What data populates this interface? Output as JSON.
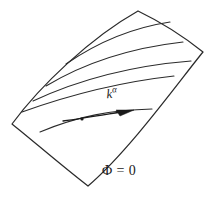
{
  "figure": {
    "kind": "line-diagram",
    "title_visible": false,
    "background_color": "#ffffff",
    "ink_color": "#2b2b2b",
    "labels": {
      "vector_base": "k",
      "vector_superscript": "α",
      "surface_equation": "Φ = 0"
    },
    "annotations": {
      "generator_curve_count": 5,
      "marked_point_count": 1,
      "arrow_count": 1
    },
    "geometry": {
      "surface_corners": {
        "top_apex": [
          138,
          11
        ],
        "right": [
          203,
          52
        ],
        "bottom_tip": [
          88,
          186
        ],
        "left": [
          12,
          124
        ]
      },
      "surface_outline_path": "M 12 124 C 40 86 90 38 138 11 C 165 24 188 40 203 52 C 180 80 130 150 88 186 C 62 166 32 140 12 124 Z",
      "generator_curves": [
        "M 66 64 C 95 44 130 28 170 22",
        "M 46 86 C 86 62 130 48 183 42",
        "M 33 101 C 78 80 128 66 191 61",
        "M 22 112 C 72 94 120 82 174 76",
        "M 40 132 C 78 116 112 110 152 109"
      ],
      "vector_arrow": {
        "shaft": "M 63 121 C 85 118 108 114 127 111",
        "head_tip": [
          134,
          110
        ],
        "head_points": "134,110 116,110 120,116"
      },
      "marked_point": {
        "center": [
          82,
          119
        ],
        "radius": 1.6
      }
    }
  }
}
